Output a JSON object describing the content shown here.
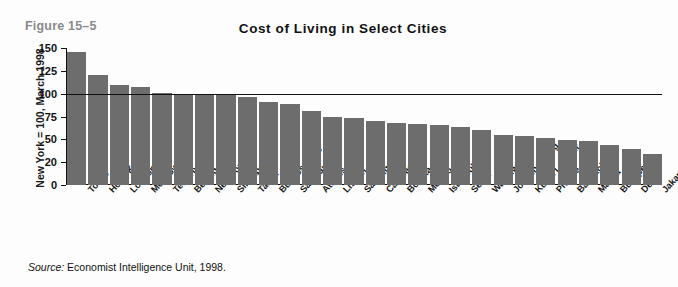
{
  "figure": {
    "number_label": "Figure 15–5"
  },
  "source": {
    "prefix": "Source:",
    "text": " Economist Intelligence Unit, 1998."
  },
  "colors": {
    "bar": "#6d6d6d",
    "axis": "#111111",
    "figure_number": "#8a8a8a",
    "reference_line": "#111111",
    "background": "#fdfdfd"
  },
  "chart_data": {
    "type": "bar",
    "title": "Cost of Living in Select Cities",
    "xlabel": "",
    "ylabel": "New York = 100, March 1998",
    "ylim": [
      0,
      150
    ],
    "grid": false,
    "legend": null,
    "ytick_labels": [
      "150",
      "125",
      "100",
      "75",
      "50",
      "20",
      "0"
    ],
    "ytick_values": [
      150,
      125,
      100,
      75,
      50,
      25,
      0
    ],
    "reference_line": {
      "value": 100,
      "label": "New York = 100"
    },
    "categories": [
      "Tokyo",
      "Hong Kong",
      "London",
      "Moscow",
      "Tel Aviv",
      "Beijing",
      "New York",
      "Singapore",
      "Taipei",
      "Buenos Aires",
      "Sao Paulo",
      "Athens",
      "Lisbon",
      "Santiago",
      "Caracas",
      "Bogota",
      "Mexico City",
      "Istanbul",
      "Seoul",
      "Warsaw",
      "Johannesburg",
      "Kuala Lumpur",
      "Prague",
      "Bangkok",
      "Manila",
      "Budapest",
      "Delhi",
      "Jakarta"
    ],
    "values": [
      146,
      121,
      110,
      107,
      101,
      100,
      100,
      100,
      96,
      91,
      89,
      81,
      74,
      73,
      70,
      68,
      67,
      66,
      64,
      60,
      55,
      54,
      52,
      49,
      48,
      44,
      39,
      34
    ]
  }
}
